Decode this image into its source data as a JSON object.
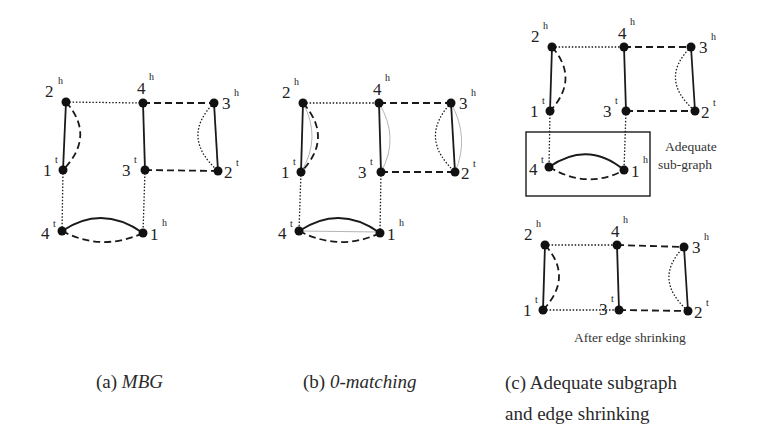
{
  "figure": {
    "panels": [
      {
        "id": "a",
        "caption_prefix": "(a)",
        "caption_text": "MBG",
        "caption_italic": true,
        "nodes": [
          {
            "id": "2h",
            "num": "2",
            "sup": "h",
            "x": 66,
            "y": 102
          },
          {
            "id": "4h",
            "num": "4",
            "sup": "h",
            "x": 143,
            "y": 103
          },
          {
            "id": "3h",
            "num": "3",
            "sup": "h",
            "x": 214,
            "y": 103
          },
          {
            "id": "1t",
            "num": "1",
            "sup": "t",
            "x": 63,
            "y": 170
          },
          {
            "id": "3t",
            "num": "3",
            "sup": "t",
            "x": 145,
            "y": 170
          },
          {
            "id": "2t",
            "num": "2",
            "sup": "t",
            "x": 218,
            "y": 171
          },
          {
            "id": "4t",
            "num": "4",
            "sup": "t",
            "x": 62,
            "y": 231
          },
          {
            "id": "1h",
            "num": "1",
            "sup": "h",
            "x": 143,
            "y": 233
          }
        ]
      },
      {
        "id": "b",
        "caption_prefix": "(b)",
        "caption_text": "0-matching",
        "caption_italic": true,
        "nodes": [
          {
            "id": "2h",
            "num": "2",
            "sup": "h",
            "x": 303,
            "y": 103
          },
          {
            "id": "4h",
            "num": "4",
            "sup": "h",
            "x": 379,
            "y": 103
          },
          {
            "id": "3h",
            "num": "3",
            "sup": "h",
            "x": 451,
            "y": 103
          },
          {
            "id": "1t",
            "num": "1",
            "sup": "t",
            "x": 301,
            "y": 172
          },
          {
            "id": "3t",
            "num": "3",
            "sup": "t",
            "x": 381,
            "y": 172
          },
          {
            "id": "2t",
            "num": "2",
            "sup": "t",
            "x": 455,
            "y": 172
          },
          {
            "id": "4t",
            "num": "4",
            "sup": "t",
            "x": 299,
            "y": 231
          },
          {
            "id": "1h",
            "num": "1",
            "sup": "h",
            "x": 380,
            "y": 233
          }
        ]
      },
      {
        "id": "c",
        "caption_prefix": "(c)",
        "caption_line1": "Adequate subgraph",
        "caption_line2": "and edge shrinking",
        "caption_italic": false,
        "box_label_line1": "Adequate",
        "box_label_line2": "sub-graph",
        "after_label": "After edge shrinking",
        "top_nodes": [
          {
            "id": "2h",
            "num": "2",
            "sup": "h",
            "x": 552,
            "y": 47
          },
          {
            "id": "4h",
            "num": "4",
            "sup": "h",
            "x": 624,
            "y": 47
          },
          {
            "id": "3h",
            "num": "3",
            "sup": "h",
            "x": 691,
            "y": 47
          },
          {
            "id": "1t",
            "num": "1",
            "sup": "t",
            "x": 550,
            "y": 111
          },
          {
            "id": "3t",
            "num": "3",
            "sup": "t",
            "x": 626,
            "y": 111
          },
          {
            "id": "2t",
            "num": "2",
            "sup": "t",
            "x": 695,
            "y": 111
          },
          {
            "id": "4t",
            "num": "4",
            "sup": "t",
            "x": 549,
            "y": 167
          },
          {
            "id": "1h",
            "num": "1",
            "sup": "h",
            "x": 624,
            "y": 170
          }
        ],
        "bottom_nodes": [
          {
            "id": "2h",
            "num": "2",
            "sup": "h",
            "x": 545,
            "y": 245
          },
          {
            "id": "4h",
            "num": "4",
            "sup": "h",
            "x": 617,
            "y": 245
          },
          {
            "id": "3h",
            "num": "3",
            "sup": "h",
            "x": 684,
            "y": 247
          },
          {
            "id": "1t",
            "num": "1",
            "sup": "t",
            "x": 543,
            "y": 310
          },
          {
            "id": "3t",
            "num": "3",
            "sup": "t",
            "x": 619,
            "y": 310
          },
          {
            "id": "2t",
            "num": "2",
            "sup": "t",
            "x": 688,
            "y": 311
          }
        ]
      }
    ],
    "edge_styles": {
      "solid": "genome A adjacency/edge (solid)",
      "dashed": "genome B edge (dashed)",
      "dotted": "edge (dotted)",
      "thin_gray": "0-matching edge (thin gray)"
    },
    "colors": {
      "ink": "#1a1a1a",
      "matching": "#b5b5b5",
      "background": "#ffffff"
    }
  }
}
